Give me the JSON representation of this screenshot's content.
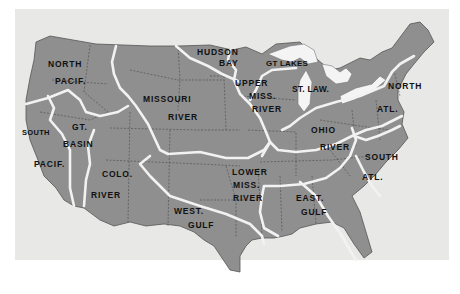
{
  "map": {
    "subject": "United States drainage basins",
    "colors": {
      "paper": "#e8e8e6",
      "land": "#8f8f8f",
      "boundary": "#f2f2f2",
      "state_lines": "#3a3a3a",
      "water": "#f4f4f4",
      "label": "#111111"
    },
    "regions": [
      {
        "id": "north-pacif",
        "lines": [
          "NORTH",
          "PACIF."
        ]
      },
      {
        "id": "south-pacif",
        "lines": [
          "SOUTH",
          "PACIF."
        ]
      },
      {
        "id": "gt-basin",
        "lines": [
          "GT.",
          "BASIN"
        ]
      },
      {
        "id": "colo-river",
        "lines": [
          "COLO.",
          "RIVER"
        ]
      },
      {
        "id": "missouri-river",
        "lines": [
          "MISSOURI",
          "RIVER"
        ]
      },
      {
        "id": "hudson-bay",
        "lines": [
          "HUDSON",
          "BAY"
        ]
      },
      {
        "id": "gt-lakes",
        "lines": [
          "GT LAKES"
        ]
      },
      {
        "id": "upper-miss-river",
        "lines": [
          "UPPER",
          "MISS.",
          "RIVER"
        ]
      },
      {
        "id": "st-law",
        "lines": [
          "ST. LAW."
        ]
      },
      {
        "id": "north-atl",
        "lines": [
          "NORTH",
          "ATL."
        ]
      },
      {
        "id": "ohio-river",
        "lines": [
          "OHIO",
          "RIVER"
        ]
      },
      {
        "id": "lower-miss-river",
        "lines": [
          "LOWER",
          "MISS.",
          "RIVER"
        ]
      },
      {
        "id": "west-gulf",
        "lines": [
          "WEST.",
          "GULF"
        ]
      },
      {
        "id": "east-gulf",
        "lines": [
          "EAST.",
          "GULF"
        ]
      },
      {
        "id": "south-atl",
        "lines": [
          "SOUTH",
          "ATL."
        ]
      }
    ]
  }
}
